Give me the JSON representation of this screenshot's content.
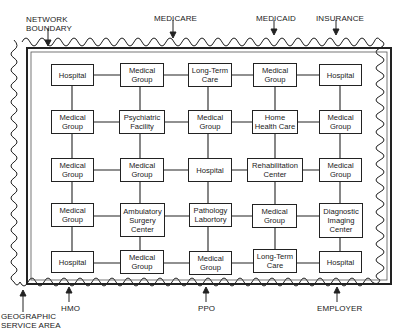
{
  "diagram": {
    "boundary_labels": {
      "network_boundary": "NETWORK\nBOUNDARY",
      "medicare": "MEDICARE",
      "medicaid": "MEDICAID",
      "insurance": "INSURANCE",
      "geographic_service_area": "GEOGRAPHIC\nSERVICE AREA",
      "hmo": "HMO",
      "ppo": "PPO",
      "employer": "EMPLOYER"
    },
    "grid": [
      [
        "Hospital",
        "Medical\nGroup",
        "Long-Term\nCare",
        "Medical\nGroup",
        "Hospital"
      ],
      [
        "Medical\nGroup",
        "Psychiatric\nFacility",
        "Medical\nGroup",
        "Home\nHealth Care",
        "Medical\nGroup"
      ],
      [
        "Medical\nGroup",
        "Medical\nGroup",
        "Hospital",
        "Rehabilitation\nCenter",
        "Medical\nGroup"
      ],
      [
        "Medical\nGroup",
        "Ambulatory\nSurgery\nCenter",
        "Pathology\nLabortory",
        "Medical\nGroup",
        "Diagnostic\nImaging\nCenter"
      ],
      [
        "Hospital",
        "Medical\nGroup",
        "Medical\nGroup",
        "Long-Term\nCare",
        "Hospital"
      ]
    ],
    "colors": {
      "line": "#222222",
      "background": "#ffffff"
    }
  }
}
